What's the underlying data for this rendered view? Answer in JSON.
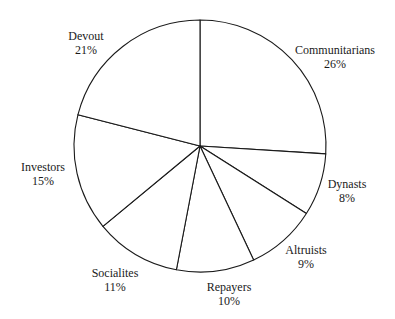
{
  "chart_data": {
    "type": "pie",
    "title": "",
    "start_angle_deg": 0,
    "direction": "clockwise",
    "center": [
      200,
      146
    ],
    "radius": 126,
    "stroke_color": "#1a1a1a",
    "fill_color": "#ffffff",
    "categories": [
      "Communitarians",
      "Dynasts",
      "Altruists",
      "Repayers",
      "Socialites",
      "Investors",
      "Devout"
    ],
    "values": [
      26,
      8,
      9,
      10,
      11,
      15,
      21
    ],
    "labels": [
      {
        "name": "Communitarians",
        "pct": "26%",
        "x": 335,
        "y": 54
      },
      {
        "name": "Dynasts",
        "pct": "8%",
        "x": 347,
        "y": 188
      },
      {
        "name": "Altruists",
        "pct": "9%",
        "x": 306,
        "y": 254
      },
      {
        "name": "Repayers",
        "pct": "10%",
        "x": 229,
        "y": 291
      },
      {
        "name": "Socialites",
        "pct": "11%",
        "x": 115,
        "y": 277
      },
      {
        "name": "Investors",
        "pct": "15%",
        "x": 43,
        "y": 171
      },
      {
        "name": "Devout",
        "pct": "21%",
        "x": 86,
        "y": 40
      }
    ],
    "legend": "none"
  }
}
